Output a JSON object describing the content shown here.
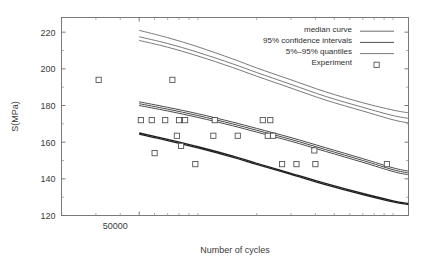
{
  "chart_data": {
    "type": "scatter",
    "title": "",
    "xlabel": "Number of cycles",
    "ylabel": "S(MPa)",
    "xscale": "log",
    "yscale": "linear",
    "xlim": [
      20000,
      1200000
    ],
    "ylim": [
      120,
      228
    ],
    "yticks": [
      120,
      140,
      160,
      180,
      200,
      220
    ],
    "ytick_labels": [
      "120",
      "140",
      "160",
      "180",
      "200",
      "220"
    ],
    "xticks": [
      50000
    ],
    "xtick_labels": [
      "50000"
    ],
    "xminor_ticks": [
      30000,
      40000,
      60000,
      70000,
      80000,
      90000,
      100000,
      200000,
      300000,
      400000,
      500000,
      600000,
      700000,
      800000,
      900000,
      1000000
    ],
    "grid": false,
    "legend_position": "top-right",
    "legend": [
      {
        "label": "median curve",
        "marker": "line",
        "color": "#5a5a5a"
      },
      {
        "label": "95% confidence intervals",
        "marker": "line",
        "color": "#3c3c3c"
      },
      {
        "label": "5%–95% quantiles",
        "marker": "line",
        "color": "#6a6a6a"
      },
      {
        "label": "Experiment",
        "marker": "square",
        "color": "#4a4a4a"
      }
    ],
    "series": [
      {
        "name": "upper bundle - 95% quantile / confidence band",
        "type": "line",
        "color": "#585858",
        "width": 0.8,
        "lines": [
          {
            "x": [
              50000,
              70000,
              100000,
              150000,
              200000,
              300000,
              450000,
              700000,
              1000000,
              1200000
            ],
            "y": [
              221.0,
              217.0,
              212.0,
              205.5,
              200.5,
              194.0,
              187.5,
              181.5,
              177.5,
              176.0
            ]
          },
          {
            "x": [
              50000,
              70000,
              100000,
              150000,
              200000,
              300000,
              450000,
              700000,
              1000000,
              1200000
            ],
            "y": [
              217.5,
              213.8,
              209.0,
              202.8,
              198.0,
              191.5,
              185.0,
              179.0,
              174.5,
              173.0
            ]
          },
          {
            "x": [
              50000,
              70000,
              100000,
              150000,
              200000,
              300000,
              450000,
              700000,
              1000000,
              1200000
            ],
            "y": [
              215.5,
              211.8,
              207.0,
              200.8,
              196.0,
              189.5,
              183.0,
              177.0,
              172.2,
              170.5
            ]
          }
        ]
      },
      {
        "name": "middle bundle - median and confidence intervals",
        "type": "line",
        "color": "#4a4a4a",
        "width": 1.0,
        "lines": [
          {
            "x": [
              50000,
              70000,
              100000,
              150000,
              200000,
              300000,
              450000,
              700000,
              1000000,
              1200000
            ],
            "y": [
              182.0,
              179.0,
              175.5,
              171.0,
              167.5,
              162.5,
              157.0,
              151.0,
              146.0,
              144.2
            ]
          },
          {
            "x": [
              50000,
              70000,
              100000,
              150000,
              200000,
              300000,
              450000,
              700000,
              1000000,
              1200000
            ],
            "y": [
              181.0,
              178.0,
              174.5,
              170.0,
              166.5,
              161.5,
              156.0,
              150.0,
              145.0,
              143.2
            ]
          },
          {
            "x": [
              50000,
              70000,
              100000,
              150000,
              200000,
              300000,
              450000,
              700000,
              1000000,
              1200000
            ],
            "y": [
              180.0,
              177.0,
              173.5,
              169.0,
              165.5,
              160.5,
              155.0,
              149.0,
              144.0,
              142.2
            ]
          }
        ]
      },
      {
        "name": "lower bundle - 5% quantile",
        "type": "line",
        "color": "#1f1f1f",
        "width": 1.3,
        "lines": [
          {
            "x": [
              50000,
              70000,
              100000,
              150000,
              200000,
              300000,
              450000,
              700000,
              1000000,
              1200000
            ],
            "y": [
              165.0,
              161.5,
              157.5,
              152.5,
              148.5,
              143.0,
              137.5,
              132.0,
              128.0,
              126.6
            ]
          },
          {
            "x": [
              50000,
              70000,
              100000,
              150000,
              200000,
              300000,
              450000,
              700000,
              1000000,
              1200000
            ],
            "y": [
              164.4,
              160.9,
              156.9,
              151.9,
              147.9,
              142.4,
              136.9,
              131.4,
              127.4,
              126.0
            ]
          }
        ]
      },
      {
        "name": "Experiment",
        "type": "scatter",
        "marker": "square",
        "color": "#4a4a4a",
        "points": [
          {
            "x": 31000,
            "y": 194
          },
          {
            "x": 74000,
            "y": 194
          },
          {
            "x": 51000,
            "y": 172
          },
          {
            "x": 58000,
            "y": 172
          },
          {
            "x": 68000,
            "y": 172
          },
          {
            "x": 80000,
            "y": 172
          },
          {
            "x": 86000,
            "y": 172
          },
          {
            "x": 122000,
            "y": 172
          },
          {
            "x": 215000,
            "y": 172
          },
          {
            "x": 235000,
            "y": 172
          },
          {
            "x": 78000,
            "y": 163.5
          },
          {
            "x": 120000,
            "y": 163.5
          },
          {
            "x": 160000,
            "y": 163.5
          },
          {
            "x": 228000,
            "y": 163.5
          },
          {
            "x": 243000,
            "y": 163.5
          },
          {
            "x": 60000,
            "y": 154
          },
          {
            "x": 82000,
            "y": 158
          },
          {
            "x": 395000,
            "y": 155.5
          },
          {
            "x": 97000,
            "y": 148
          },
          {
            "x": 270000,
            "y": 148
          },
          {
            "x": 320000,
            "y": 148
          },
          {
            "x": 400000,
            "y": 148
          },
          {
            "x": 930000,
            "y": 148
          }
        ]
      }
    ]
  },
  "axes": {
    "ylabel": "S(MPa)",
    "xlabel": "Number of cycles"
  }
}
